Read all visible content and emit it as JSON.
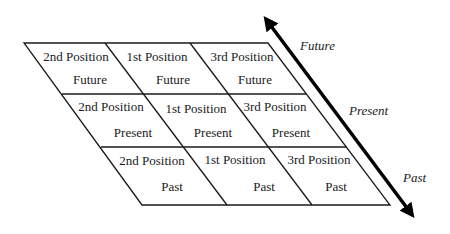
{
  "diagram": {
    "rows": [
      {
        "time": "Future",
        "cells": [
          {
            "position": "2nd Position",
            "time": "Future"
          },
          {
            "position": "1st Position",
            "time": "Future"
          },
          {
            "position": "3rd Position",
            "time": "Future"
          }
        ]
      },
      {
        "time": "Present",
        "cells": [
          {
            "position": "2nd Position",
            "time": "Present"
          },
          {
            "position": "1st Position",
            "time": "Present"
          },
          {
            "position": "3rd Position",
            "time": "Present"
          }
        ]
      },
      {
        "time": "Past",
        "cells": [
          {
            "position": "2nd Position",
            "time": "Past"
          },
          {
            "position": "1st Position",
            "time": "Past"
          },
          {
            "position": "3rd Position",
            "time": "Past"
          }
        ]
      }
    ],
    "axis": {
      "labels": [
        "Future",
        "Present",
        "Past"
      ],
      "arrow": "double-headed-diagonal-arrow"
    },
    "colors": {
      "line": "#1a1a1a",
      "text": "#1a1a1a",
      "background": "#ffffff"
    }
  }
}
